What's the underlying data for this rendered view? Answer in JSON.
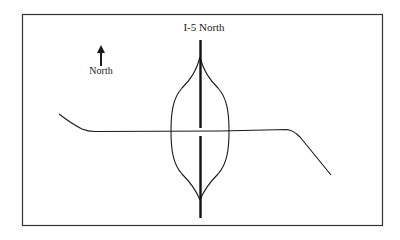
{
  "diagram": {
    "title": "I-5 North",
    "compass": {
      "label": "North",
      "icon": "north-arrow-icon"
    },
    "colors": {
      "line": "#1a1a1a",
      "border": "#333333",
      "background": "#ffffff"
    },
    "elements": [
      {
        "type": "highway",
        "name": "I-5",
        "direction": "north-south"
      },
      {
        "type": "crossroad",
        "direction": "east-west"
      },
      {
        "type": "interchange",
        "style": "loops on both sides of highway"
      }
    ]
  }
}
